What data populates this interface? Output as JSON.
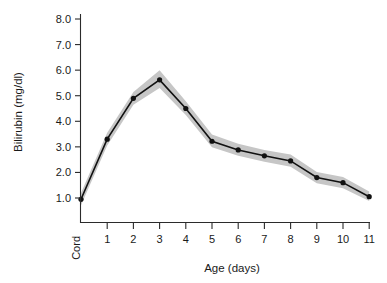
{
  "chart_data": {
    "type": "line",
    "title": "",
    "subtitle": "",
    "xlabel": "Age (days)",
    "ylabel": "Bilirubin (mg/dl)",
    "categories": [
      "Cord",
      "1",
      "2",
      "3",
      "4",
      "5",
      "6",
      "7",
      "8",
      "9",
      "10",
      "11"
    ],
    "x_tick_labels": [
      "Cord",
      "1",
      "2",
      "3",
      "4",
      "5",
      "6",
      "7",
      "8",
      "9",
      "10",
      "11"
    ],
    "y_tick_labels": [
      "1.0",
      "2.0",
      "3.0",
      "4.0",
      "5.0",
      "6.0",
      "7.0",
      "8.0"
    ],
    "y_ticks": [
      1.0,
      2.0,
      3.0,
      4.0,
      5.0,
      6.0,
      7.0,
      8.0
    ],
    "ylim": [
      0.3,
      8.0
    ],
    "xlim": [
      -0.3,
      11.2
    ],
    "grid": false,
    "legend": null,
    "legend_position": "none",
    "series": [
      {
        "name": "Bilirubin",
        "values": [
          0.95,
          3.3,
          4.9,
          5.62,
          4.5,
          3.22,
          2.88,
          2.65,
          2.45,
          1.8,
          1.6,
          1.05
        ],
        "marker": "circle",
        "color": "#111111"
      }
    ],
    "band": {
      "name": "Confidence band",
      "color": "#c6c6c6",
      "upper": [
        1.2,
        3.55,
        5.15,
        6.0,
        4.78,
        3.48,
        3.12,
        2.88,
        2.7,
        2.02,
        1.82,
        1.25
      ],
      "lower": [
        0.72,
        3.05,
        4.65,
        5.3,
        4.25,
        2.98,
        2.65,
        2.42,
        2.22,
        1.58,
        1.38,
        0.88
      ]
    },
    "annotations": []
  },
  "axis": {
    "y_label": "Bilirubin (mg/dl)",
    "x_label": "Age (days)"
  },
  "colors": {
    "line": "#111111",
    "band": "#c6c6c6",
    "axis": "#2b2b2b",
    "background": "#ffffff"
  }
}
